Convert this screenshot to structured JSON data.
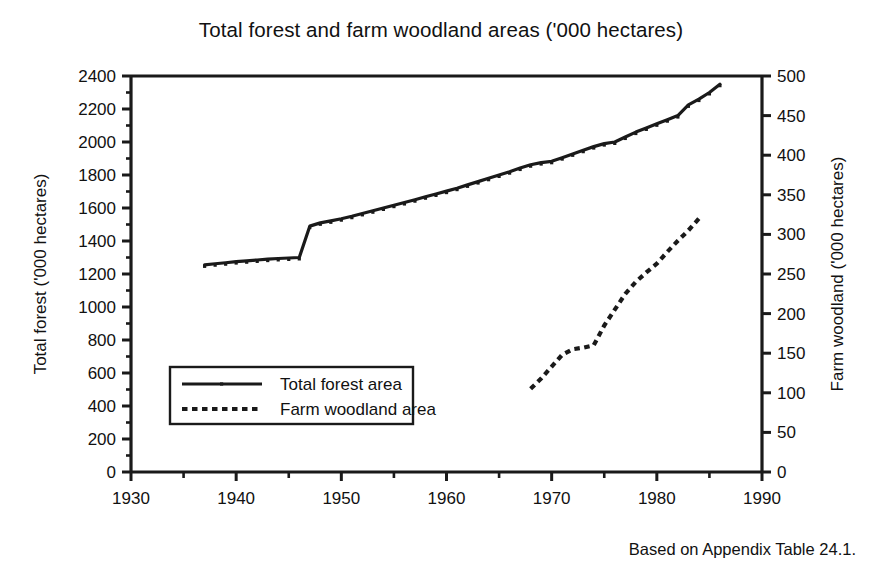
{
  "chart_data": {
    "type": "line",
    "title": "Total forest and farm woodland areas ('000 hectares)",
    "xlabel": "",
    "ylabel": "Total forest ('000 hectares)",
    "y2label": "Farm woodland ('000 hectares)",
    "xlim": [
      1930,
      1990
    ],
    "ylim": [
      0,
      2400
    ],
    "y2lim": [
      0,
      500
    ],
    "xticks": [
      1930,
      1940,
      1950,
      1960,
      1970,
      1980,
      1990
    ],
    "xtick_labels": [
      "1930",
      "1940",
      "1950",
      "1960",
      "1970",
      "1980",
      "1990"
    ],
    "xminor_step": 5,
    "yticks": [
      0,
      200,
      400,
      600,
      800,
      1000,
      1200,
      1400,
      1600,
      1800,
      2000,
      2200,
      2400
    ],
    "ytick_labels": [
      "0",
      "200",
      "400",
      "600",
      "800",
      "1000",
      "1200",
      "1400",
      "1600",
      "1800",
      "2000",
      "2200",
      "2400"
    ],
    "yminor_step": 100,
    "y2ticks": [
      0,
      50,
      100,
      150,
      200,
      250,
      300,
      350,
      400,
      450,
      500
    ],
    "y2tick_labels": [
      "0",
      "50",
      "100",
      "150",
      "200",
      "250",
      "300",
      "350",
      "400",
      "450",
      "500"
    ],
    "grid": false,
    "legend_position": "lower left",
    "series": [
      {
        "name": "Total forest area",
        "axis": "left",
        "style": "solid",
        "color": "#1a1a1a",
        "x": [
          1937,
          1938,
          1939,
          1940,
          1941,
          1942,
          1943,
          1944,
          1945,
          1946,
          1947,
          1948,
          1949,
          1950,
          1951,
          1952,
          1953,
          1954,
          1955,
          1956,
          1957,
          1958,
          1959,
          1960,
          1961,
          1962,
          1963,
          1964,
          1965,
          1966,
          1967,
          1968,
          1969,
          1970,
          1971,
          1972,
          1973,
          1974,
          1975,
          1976,
          1977,
          1978,
          1979,
          1980,
          1981,
          1982,
          1983,
          1984,
          1985,
          1986
        ],
        "y": [
          1255,
          1262,
          1268,
          1275,
          1280,
          1285,
          1290,
          1294,
          1297,
          1300,
          1490,
          1510,
          1522,
          1535,
          1550,
          1567,
          1583,
          1600,
          1617,
          1633,
          1650,
          1668,
          1685,
          1702,
          1720,
          1740,
          1760,
          1780,
          1800,
          1820,
          1842,
          1862,
          1875,
          1883,
          1905,
          1928,
          1950,
          1972,
          1990,
          2000,
          2030,
          2060,
          2085,
          2110,
          2135,
          2160,
          2225,
          2260,
          2300,
          2350
        ]
      },
      {
        "name": "Farm woodland area",
        "axis": "right",
        "style": "dotted",
        "color": "#1a1a1a",
        "x": [
          1968,
          1969,
          1970,
          1971,
          1972,
          1973,
          1974,
          1975,
          1976,
          1977,
          1978,
          1979,
          1980,
          1981,
          1982,
          1983,
          1984
        ],
        "y": [
          105,
          118,
          133,
          148,
          155,
          157,
          160,
          185,
          205,
          225,
          240,
          252,
          263,
          278,
          292,
          305,
          320
        ]
      }
    ]
  },
  "source_note": "Based on Appendix Table 24.1.",
  "legend": {
    "entries": [
      {
        "label": "Total forest area",
        "style": "solid"
      },
      {
        "label": "Farm woodland area",
        "style": "dotted"
      }
    ]
  }
}
